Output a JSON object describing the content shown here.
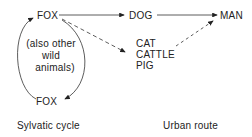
{
  "nodes": {
    "fox_top": "FOX",
    "fox_bottom": "FOX",
    "dog": "DOG",
    "man": "MAN",
    "cat": "CAT",
    "cattle": "CATTLE",
    "pig": "PIG",
    "note_line1": "(also other",
    "note_line2": "wild",
    "note_line3": "animals)"
  },
  "labels": {
    "sylvatic": "Sylvatic cycle",
    "urban": "Urban route"
  }
}
